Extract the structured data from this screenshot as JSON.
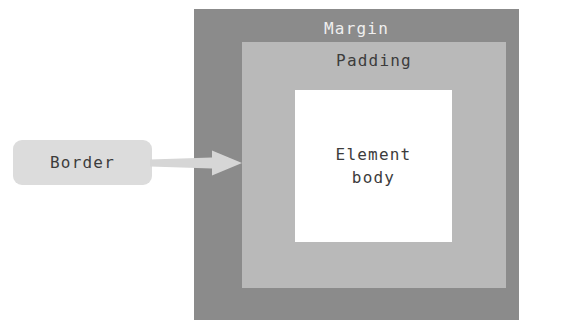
{
  "diagram": {
    "type": "nested-box-model",
    "colors": {
      "margin_fill": "#8b8b8b",
      "padding_fill": "#b9b9b9",
      "content_fill": "#ffffff",
      "callout_fill": "#dcdcdc",
      "arrow_fill": "#d6d6d6",
      "light_text": "#efefef",
      "dark_text": "#3c3c3c",
      "page_background": "#ffffff"
    },
    "layers": {
      "margin": {
        "label": "Margin"
      },
      "padding": {
        "label": "Padding"
      },
      "content": {
        "label_line1": "Element",
        "label_line2": "body"
      }
    },
    "callout": {
      "label": "Border",
      "points_to": "margin"
    }
  }
}
